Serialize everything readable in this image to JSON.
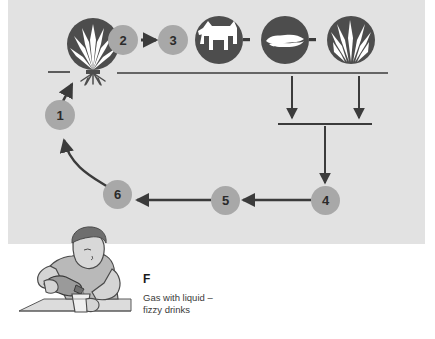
{
  "figure": {
    "label": "F",
    "caption_line_1": "Gas with liquid –",
    "caption_line_2": "fizzy drinks",
    "panel_color": "#e2e2e2",
    "dark_icon_color": "#4d4d4d",
    "number_token_color": "#a8a8a8",
    "line_color": "#3b3b3b"
  },
  "nodes": {
    "plant_icon": "plant-with-roots-icon",
    "cow_icon": "cow-icon",
    "decay_icon": "decaying-matter-icon",
    "grass_icon": "grass-icon",
    "boy_icon": "boy-pouring-fizzy-drink-icon",
    "ground_line": "ground-line",
    "collector_bar": "collector-bar"
  },
  "steps": [
    {
      "id": "1",
      "label": "1"
    },
    {
      "id": "2",
      "label": "2"
    },
    {
      "id": "3",
      "label": "3"
    },
    {
      "id": "4",
      "label": "4"
    },
    {
      "id": "5",
      "label": "5"
    },
    {
      "id": "6",
      "label": "6"
    }
  ],
  "connectors": [
    {
      "name": "arrow-2-to-3",
      "direction": "right"
    },
    {
      "name": "dash-cow-to-decay",
      "direction": "link"
    },
    {
      "name": "dash-decay-to-grass",
      "direction": "link"
    },
    {
      "name": "arrow-decay-down",
      "direction": "down"
    },
    {
      "name": "arrow-grass-down",
      "direction": "down"
    },
    {
      "name": "arrow-bar-to-4",
      "direction": "down"
    },
    {
      "name": "arrow-4-to-5",
      "direction": "left"
    },
    {
      "name": "arrow-5-to-6",
      "direction": "left"
    },
    {
      "name": "arrow-6-to-1",
      "direction": "curve-up-left"
    },
    {
      "name": "arrow-1-to-plant",
      "direction": "up"
    }
  ]
}
